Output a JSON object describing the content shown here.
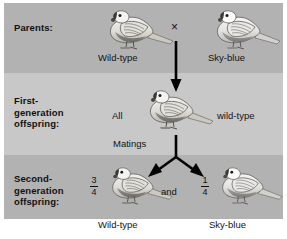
{
  "figure": {
    "type": "genetics-cross-diagram",
    "organism": "budgerigar",
    "background_bands": [
      "#b2b2b2",
      "#c8c8c8",
      "#b2b2b2"
    ],
    "page_background": "#ffffff"
  },
  "stages": {
    "parents": {
      "label_line1": "Parents:",
      "cross_symbol": "×",
      "left": {
        "caption": "Wild-type",
        "bird_name": "wild-type-budgerigar"
      },
      "right": {
        "caption": "Sky-blue",
        "bird_name": "sky-blue-budgerigar"
      }
    },
    "first_generation": {
      "label_line1": "First-",
      "label_line2": "generation",
      "label_line3": "offspring:",
      "quantifier": "All",
      "phenotype": "wild-type",
      "matings": "Matings",
      "bird_name": "f1-wild-type-budgerigar"
    },
    "second_generation": {
      "label_line1": "Second-",
      "label_line2": "generation",
      "label_line3": "offspring:",
      "conjunction": "and",
      "left": {
        "numerator": "3",
        "denominator": "4",
        "caption": "Wild-type",
        "bird_name": "f2-wild-type-budgerigar"
      },
      "right": {
        "numerator": "1",
        "denominator": "4",
        "caption": "Sky-blue",
        "bird_name": "f2-sky-blue-budgerigar"
      }
    }
  },
  "arrows": {
    "parents_to_f1": "down-arrow-icon",
    "f1_to_f2": "branching-y-arrow-icon"
  }
}
